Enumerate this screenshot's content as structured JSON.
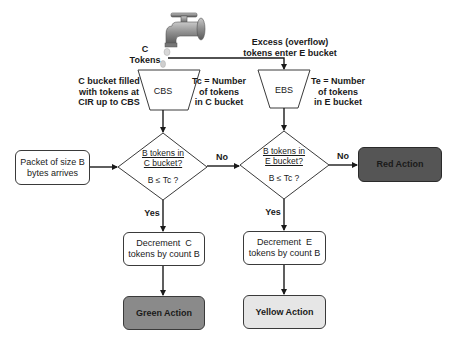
{
  "faucet": {
    "label_line1": "C",
    "label_line2": "Tokens",
    "overflow_line1": "Excess (overflow)",
    "overflow_line2": "tokens enter E bucket"
  },
  "c_bucket": {
    "name": "CBS",
    "left_note": [
      "C bucket filled",
      "with tokens at",
      "CIR up to CBS"
    ],
    "right_note": [
      "Tc = Number",
      "of tokens",
      "in C bucket"
    ]
  },
  "e_bucket": {
    "name": "EBS",
    "right_note": [
      "Te = Number",
      "of tokens",
      "in E bucket"
    ]
  },
  "start": {
    "line1": "Packet of size B",
    "line2": "bytes arrives"
  },
  "decision_c": {
    "question_line1": "B tokens in",
    "question_line2": "C bucket?",
    "condition": "B ≤ Tc ?",
    "no_label": "No",
    "yes_label": "Yes"
  },
  "decision_e": {
    "question_line1": "B tokens in",
    "question_line2": "E bucket?",
    "condition": "B ≤ Tc ?",
    "no_label": "No",
    "yes_label": "Yes"
  },
  "decrement_c": {
    "line1": "Decrement  C",
    "line2": "tokens by count B"
  },
  "decrement_e": {
    "line1": "Decrement  E",
    "line2": "tokens by count B"
  },
  "actions": {
    "red": "Red Action",
    "green": "Green Action",
    "yellow": "Yellow Action"
  },
  "colors": {
    "red_fill": "#555555",
    "green_fill": "#8a8a8a",
    "yellow_fill": "#e6e6e6",
    "stroke": "#1a1a1a"
  }
}
